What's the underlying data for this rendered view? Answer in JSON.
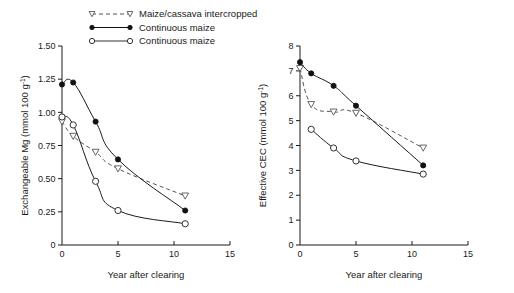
{
  "figure": {
    "width": 514,
    "height": 293,
    "background": "#ffffff",
    "foreground": "#1a1a1a"
  },
  "legend": {
    "position": "top-center-left",
    "items": [
      {
        "label": "Maize/cassava intercropped",
        "marker": "triangle-down-open",
        "line": "dashed",
        "color": "#555555"
      },
      {
        "label": "Continuous maize",
        "marker": "circle-filled",
        "line": "solid",
        "color": "#111111"
      },
      {
        "label": "Continuous maize",
        "marker": "circle-open",
        "line": "solid",
        "color": "#333333"
      }
    ]
  },
  "chart_data": [
    {
      "id": "panel-left",
      "type": "scatter",
      "title": "",
      "xlabel": "Year after clearing",
      "ylabel": "Exchangeable Mg (mmol 100 g",
      "ylabel_sup": "-1",
      "ylabel_tail": ")",
      "xlim": [
        0,
        15
      ],
      "ylim": [
        0,
        1.5
      ],
      "xticks": [
        0,
        5,
        10,
        15
      ],
      "xticklabels": [
        "0",
        "5",
        "10",
        "15"
      ],
      "yticks": [
        0,
        0.25,
        0.5,
        0.75,
        1.0,
        1.25,
        1.5
      ],
      "yticklabels": [
        "0",
        "0.25",
        "0.50",
        "0.75",
        "1.00",
        "1.25",
        "1.50"
      ],
      "grid": false,
      "series": [
        {
          "name": "Maize/cassava intercropped",
          "marker": "triangle-down-open",
          "line": "dashed",
          "x": [
            0,
            1,
            3,
            5,
            11
          ],
          "y": [
            0.93,
            0.82,
            0.7,
            0.575,
            0.37
          ]
        },
        {
          "name": "Continuous maize",
          "marker": "circle-filled",
          "line": "solid",
          "x": [
            0,
            1,
            3,
            5,
            11
          ],
          "y": [
            1.21,
            1.225,
            0.93,
            0.645,
            0.26
          ]
        },
        {
          "name": "Continuous maize",
          "marker": "circle-open",
          "line": "solid",
          "x": [
            0,
            1,
            3,
            5,
            11
          ],
          "y": [
            0.965,
            0.905,
            0.48,
            0.26,
            0.16
          ]
        }
      ]
    },
    {
      "id": "panel-right",
      "type": "scatter",
      "title": "",
      "xlabel": "Year after clearing",
      "ylabel": "Effective CEC (mmol 100 g",
      "ylabel_sup": "-1",
      "ylabel_tail": ")",
      "xlim": [
        0,
        15
      ],
      "ylim": [
        0,
        8
      ],
      "xticks": [
        0,
        5,
        10,
        15
      ],
      "xticklabels": [
        "0",
        "5",
        "10",
        "15"
      ],
      "yticks": [
        0,
        1,
        2,
        3,
        4,
        5,
        6,
        7,
        8
      ],
      "yticklabels": [
        "0",
        "1",
        "2",
        "3",
        "4",
        "5",
        "6",
        "7",
        "8"
      ],
      "grid": false,
      "series": [
        {
          "name": "Maize/cassava intercropped",
          "marker": "triangle-down-open",
          "line": "dashed",
          "x": [
            0,
            1,
            3,
            5,
            11
          ],
          "y": [
            7.1,
            5.65,
            5.35,
            5.3,
            3.9
          ]
        },
        {
          "name": "Continuous maize",
          "marker": "circle-filled",
          "line": "solid",
          "x": [
            0,
            1,
            3,
            5,
            11
          ],
          "y": [
            7.35,
            6.9,
            6.4,
            5.6,
            3.2
          ]
        },
        {
          "name": "Continuous maize",
          "marker": "circle-open",
          "line": "solid",
          "x": [
            1,
            3,
            5,
            11
          ],
          "y": [
            4.65,
            3.9,
            3.38,
            2.85
          ]
        }
      ]
    }
  ]
}
